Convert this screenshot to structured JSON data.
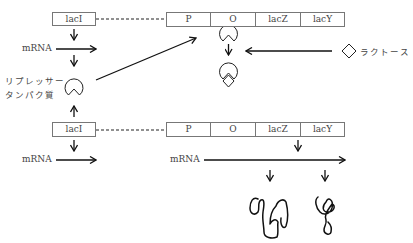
{
  "diagram": {
    "top_row": {
      "regulator_gene": "lacI",
      "operon_segments": [
        "P",
        "O",
        "lacZ",
        "lacY"
      ],
      "mrna_label": "mRNA",
      "repressor_label_line1": "リプレッサー",
      "repressor_label_line2": "タンパク質",
      "inducer_label": "ラクトース"
    },
    "bottom_row": {
      "regulator_gene": "lacI",
      "operon_segments": [
        "P",
        "O",
        "lacZ",
        "lacY"
      ],
      "mrna_label_left": "mRNA",
      "mrna_label_right": "mRNA"
    },
    "colors": {
      "line": "#111111",
      "box_border": "#777777",
      "text": "#444444"
    }
  }
}
